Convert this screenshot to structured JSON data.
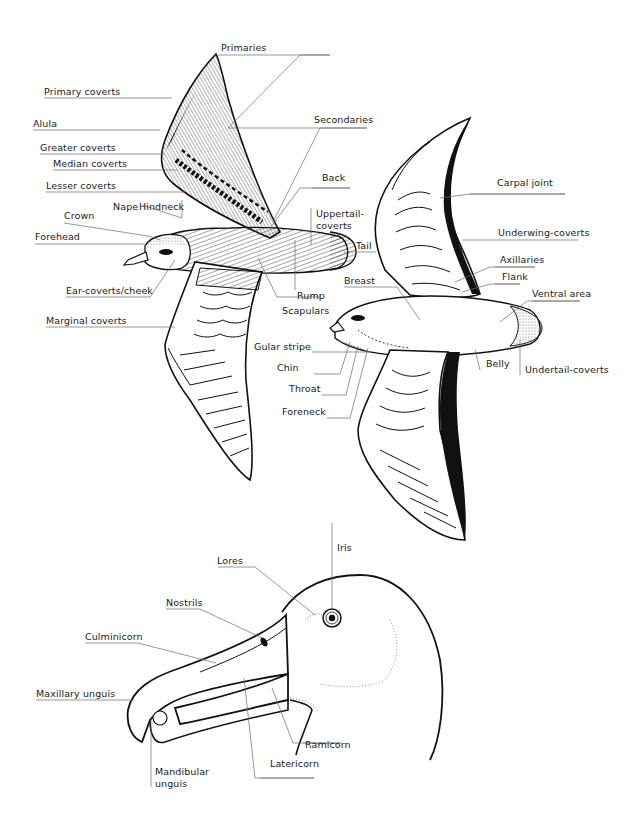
{
  "diagram": {
    "type": "bird-topography-illustration",
    "colors": {
      "ink": "#111111",
      "leader": "#6a6a6a",
      "background": "#ffffff"
    },
    "upper_bird": {
      "view": "dorsal (upperparts)",
      "labels": {
        "primaries": "Primaries",
        "primary_coverts": "Primary coverts",
        "alula": "Alula",
        "secondaries": "Secondaries",
        "greater_coverts": "Greater coverts",
        "median_coverts": "Median coverts",
        "lesser_coverts": "Lesser coverts",
        "back": "Back",
        "nape": "Nape",
        "hindneck": "Hindneck",
        "crown": "Crown",
        "uppertail_coverts": "Uppertail-\ncoverts",
        "uppertail_coverts_l1": "Uppertail-",
        "uppertail_coverts_l2": "coverts",
        "forehead": "Forehead",
        "tail": "Tail",
        "ear_coverts": "Ear-coverts/cheek",
        "rump": "Rump",
        "scapulars": "Scapulars",
        "marginal_coverts": "Marginal coverts"
      }
    },
    "lower_bird": {
      "view": "ventral (underparts)",
      "labels": {
        "carpal_joint": "Carpal joint",
        "underwing_coverts": "Underwing-coverts",
        "axillaries": "Axillaries",
        "flank": "Flank",
        "breast": "Breast",
        "ventral_area": "Ventral area",
        "gular_stripe": "Gular stripe",
        "chin": "Chin",
        "throat": "Throat",
        "foreneck": "Foreneck",
        "belly": "Belly",
        "undertail_coverts": "Undertail-coverts"
      }
    },
    "head_detail": {
      "view": "albatross head and bill",
      "labels": {
        "iris": "Iris",
        "lores": "Lores",
        "nostrils": "Nostrils",
        "culminicorn": "Culminicorn",
        "maxillary_unguis": "Maxillary unguis",
        "ramicorn": "Ramicorn",
        "latericorn": "Latericorn",
        "mandibular_unguis_l1": "Mandibular",
        "mandibular_unguis_l2": "unguis"
      }
    }
  }
}
